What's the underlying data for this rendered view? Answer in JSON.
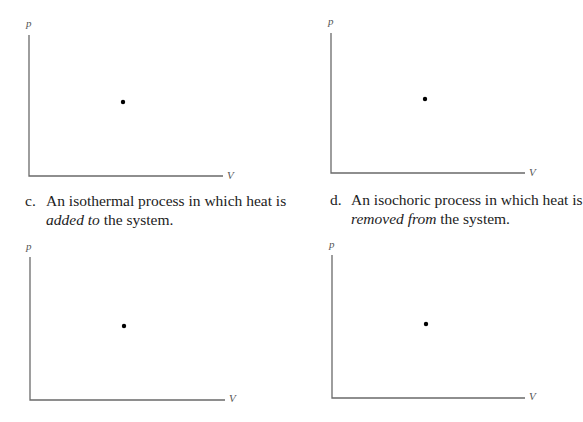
{
  "panels": [
    {
      "id": "a",
      "axis_labels": {
        "y": "p",
        "x": "V"
      },
      "state_point": {
        "x": 123,
        "y": 102
      },
      "axes": {
        "origin": [
          29,
          176
        ],
        "top": 35,
        "right": 223
      }
    },
    {
      "id": "b",
      "axis_labels": {
        "y": "p",
        "x": "V"
      },
      "state_point": {
        "x": 425,
        "y": 99
      },
      "axes": {
        "origin": [
          331,
          173
        ],
        "top": 33,
        "right": 525
      }
    },
    {
      "id": "c",
      "caption": {
        "letter": "c.",
        "line1": "An isothermal process in which heat is",
        "emphasis": "added to",
        "rest": " the system."
      },
      "axis_labels": {
        "y": "p",
        "x": "V"
      },
      "state_point": {
        "x": 124,
        "y": 326
      },
      "axes": {
        "origin": [
          30,
          400
        ],
        "top": 257,
        "right": 225
      }
    },
    {
      "id": "d",
      "caption": {
        "letter": "d.",
        "line1": "An isochoric process in which heat is",
        "emphasis": "removed from",
        "rest": " the system."
      },
      "axis_labels": {
        "y": "p",
        "x": "V"
      },
      "state_point": {
        "x": 426,
        "y": 324
      },
      "axes": {
        "origin": [
          332,
          398
        ],
        "top": 255,
        "right": 525
      }
    }
  ],
  "colors": {
    "axis": "#6a6a6a",
    "point": "#000000",
    "text": "#222222"
  }
}
